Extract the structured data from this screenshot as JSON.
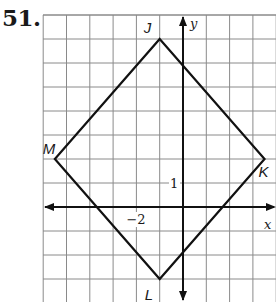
{
  "problem": {
    "number_label": "51."
  },
  "colors": {
    "grid": "#8a8a8a",
    "axis": "#111111",
    "shape": "#111111",
    "text": "#1a1a1a"
  },
  "graph": {
    "x_range": [
      -7,
      4
    ],
    "y_range": [
      -4,
      8
    ],
    "origin_px": [
      183,
      207
    ],
    "unit_px": [
      23.3,
      24
    ],
    "grid_left_px": 43,
    "grid_top_px": 15,
    "grid_right_px": 276,
    "grid_bottom_px": 302,
    "x_axis_label": "x",
    "y_axis_label": "y",
    "tick_labels": [
      {
        "axis": "x",
        "value": -2,
        "text": "−2"
      },
      {
        "axis": "y",
        "value": 1,
        "text": "1"
      }
    ]
  },
  "shape": {
    "type": "rhombus",
    "vertices": [
      {
        "name": "J",
        "x": -1,
        "y": 7
      },
      {
        "name": "K",
        "x": 3.5,
        "y": 2
      },
      {
        "name": "L",
        "x": -1,
        "y": -3
      },
      {
        "name": "M",
        "x": -5.5,
        "y": 2
      }
    ]
  }
}
